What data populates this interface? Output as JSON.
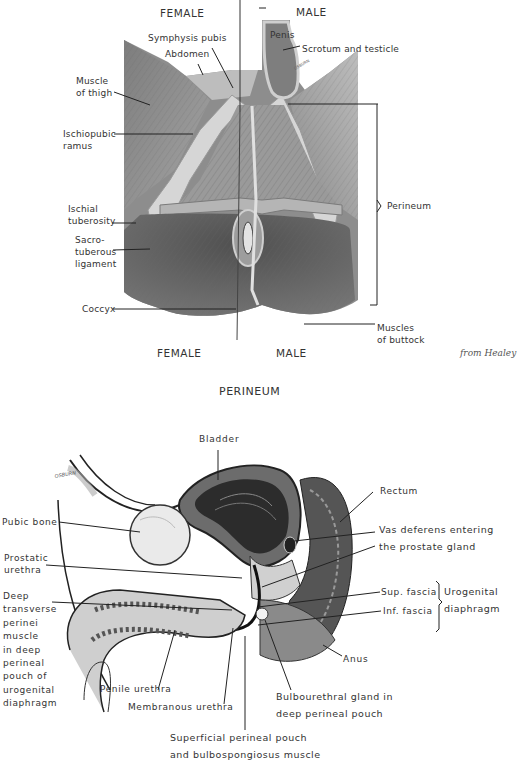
{
  "figure_top": {
    "headers": {
      "female_top": "FEMALE",
      "male_top": "MALE",
      "female_bottom": "FEMALE",
      "male_bottom": "MALE"
    },
    "labels": {
      "symphysis_pubis": "Symphysis pubis",
      "abdomen": "Abdomen",
      "muscle_of_thigh": [
        "Muscle",
        "of thigh"
      ],
      "ischiopubic_ramus": [
        "Ischiopubic",
        "ramus"
      ],
      "ischial_tuberosity": [
        "Ischial",
        "tuberosity"
      ],
      "sacrotuberous_ligament": [
        "Sacro-",
        "tuberous",
        "ligament"
      ],
      "coccyx": "Coccyx",
      "penis": "Penis",
      "scrotum_and_testicle": "Scrotum and testicle",
      "perineum": "Perineum",
      "muscles_of_buttock": [
        "Muscles",
        "of buttock"
      ]
    },
    "credit": "from Healey",
    "title": "PERINEUM",
    "artist_signature": "OSBURN"
  },
  "figure_bottom": {
    "labels": {
      "bladder": "Bladder",
      "rectum": "Rectum",
      "pubic_bone": "Pubic bone",
      "prostatic_urethra": [
        "Prostatic",
        "urethra"
      ],
      "vas_deferens": [
        "Vas deferens entering",
        "the prostate gland"
      ],
      "deep_transverse_perinei": [
        "Deep",
        "transverse",
        "perinei",
        "muscle",
        "in deep",
        "perineal",
        "pouch of",
        "urogenital",
        "diaphragm"
      ],
      "sup_fascia": "Sup. fascia",
      "inf_fascia": "Inf. fascia",
      "urogenital_diaphragm": [
        "Urogenital",
        "diaphragm"
      ],
      "anus": "Anus",
      "penile_urethra": "Penile urethra",
      "membranous_urethra": "Membranous urethra",
      "bulbourethral_gland": [
        "Bulbourethral gland in",
        "deep perineal pouch"
      ],
      "superficial_perineal_pouch": [
        "Superficial perineal pouch",
        "and bulbospongiosus muscle"
      ]
    },
    "artist_signature": "OSBURN"
  },
  "colors": {
    "background": "#ffffff",
    "ink": "#2a2a2a",
    "tissue_dark": "#5a5a5a",
    "tissue_mid": "#8a8a8a",
    "tissue_light": "#c8c8c8"
  }
}
